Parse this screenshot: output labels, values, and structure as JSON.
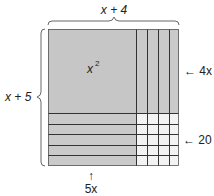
{
  "diagram": {
    "top_label": "x + 4",
    "left_label": "x + 5",
    "square_label": "x",
    "square_exponent": "2",
    "right_label_top": "← 4x",
    "right_label_bottom": "← 20",
    "bottom_arrow": "↑",
    "bottom_label": "5x",
    "colors": {
      "shaded": "#c8c8c8",
      "unshaded": "#f2f2f2",
      "line": "#333333"
    }
  }
}
